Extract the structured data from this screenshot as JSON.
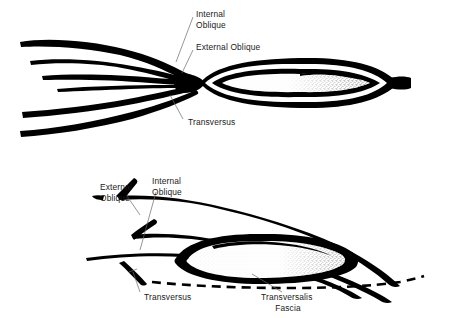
{
  "figure": {
    "background_color": "#ffffff",
    "ink_color": "#000000",
    "leader_color": "#6a6a6a",
    "width": 464,
    "height": 318
  },
  "panels": [
    {
      "id": "upper-panel",
      "name": "upper-diagram",
      "description": "Fanned muscle layers converging into an elongated stippled ellipse tapering to a point at right",
      "labels": [
        {
          "key": "internal_oblique",
          "name": "label-internal-oblique",
          "lines": [
            "Internal",
            "Oblique"
          ],
          "x": 196,
          "y": 14,
          "align": "start"
        },
        {
          "key": "external_oblique",
          "name": "label-external-oblique",
          "lines": [
            "External Oblique"
          ],
          "x": 196,
          "y": 48,
          "align": "start"
        },
        {
          "key": "transversus",
          "name": "label-transversus",
          "lines": [
            "Transversus"
          ],
          "x": 186,
          "y": 122,
          "align": "start"
        }
      ]
    },
    {
      "id": "lower-panel",
      "name": "lower-diagram",
      "description": "Oblique muscle layers sweeping right with stippled ellipse above a dashed transversalis fascia line",
      "labels": [
        {
          "key": "external_oblique",
          "name": "label-external-oblique",
          "lines": [
            "External",
            "Oblique"
          ],
          "x": 100,
          "y": 190,
          "align": "start"
        },
        {
          "key": "internal_oblique",
          "name": "label-internal-oblique",
          "lines": [
            "Internal",
            "Oblique"
          ],
          "x": 152,
          "y": 184,
          "align": "start"
        },
        {
          "key": "transversus",
          "name": "label-transversus",
          "lines": [
            "Transversus"
          ],
          "x": 144,
          "y": 297,
          "align": "start"
        },
        {
          "key": "transversalis_fascia",
          "name": "label-transversalis-fascia",
          "lines": [
            "Transversalis",
            "Fascia"
          ],
          "x": 288,
          "y": 297,
          "align": "middle"
        }
      ]
    }
  ],
  "structures": [
    {
      "name": "external-oblique",
      "label": "External Oblique",
      "appears_in": [
        "upper-panel",
        "lower-panel"
      ],
      "render": "solid black band"
    },
    {
      "name": "internal-oblique",
      "label": "Internal Oblique",
      "appears_in": [
        "upper-panel",
        "lower-panel"
      ],
      "render": "solid black band"
    },
    {
      "name": "transversus",
      "label": "Transversus",
      "appears_in": [
        "upper-panel",
        "lower-panel"
      ],
      "render": "solid black band"
    },
    {
      "name": "transversalis-fascia",
      "label": "Transversalis Fascia",
      "appears_in": [
        "lower-panel"
      ],
      "render": "dashed line"
    },
    {
      "name": "spermatic-cord",
      "label": "",
      "appears_in": [
        "upper-panel",
        "lower-panel"
      ],
      "render": "stippled ellipse with black border"
    }
  ]
}
